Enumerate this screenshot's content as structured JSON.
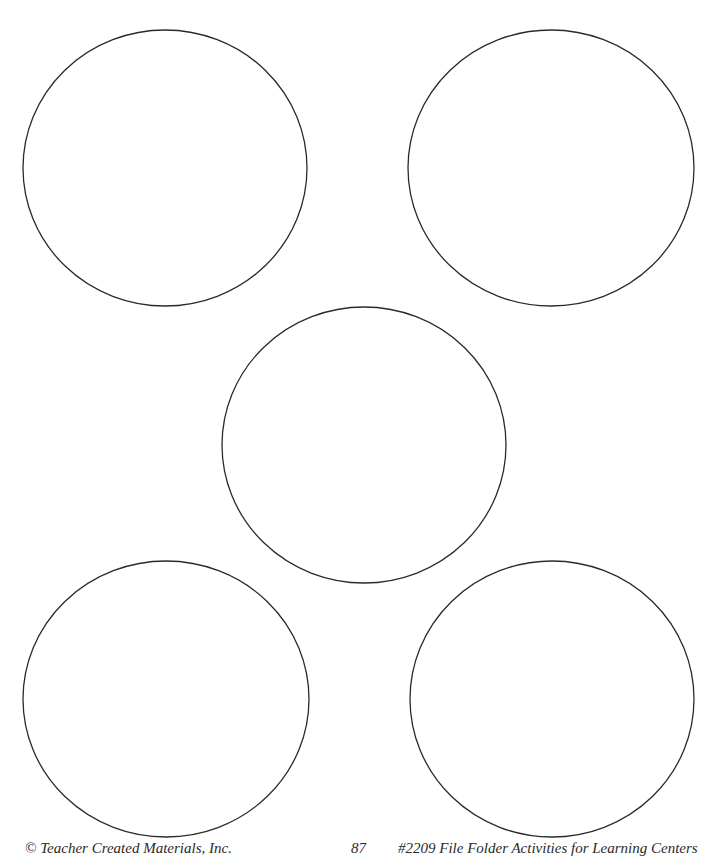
{
  "page": {
    "background": "#ffffff",
    "stroke_color": "#2a2a2a"
  },
  "circles": [
    {
      "id": "top-left",
      "cx": 165,
      "cy": 168,
      "rx": 142,
      "ry": 138
    },
    {
      "id": "top-right",
      "cx": 551,
      "cy": 168,
      "rx": 143,
      "ry": 138
    },
    {
      "id": "center",
      "cx": 364,
      "cy": 445,
      "rx": 142,
      "ry": 138
    },
    {
      "id": "bottom-left",
      "cx": 166,
      "cy": 699,
      "rx": 143,
      "ry": 138
    },
    {
      "id": "bottom-right",
      "cx": 552,
      "cy": 699,
      "rx": 142,
      "ry": 138
    }
  ],
  "footer": {
    "copyright": "© Teacher Created Materials, Inc.",
    "page_number": "87",
    "book_title": "#2209 File Folder Activities for Learning Centers"
  }
}
